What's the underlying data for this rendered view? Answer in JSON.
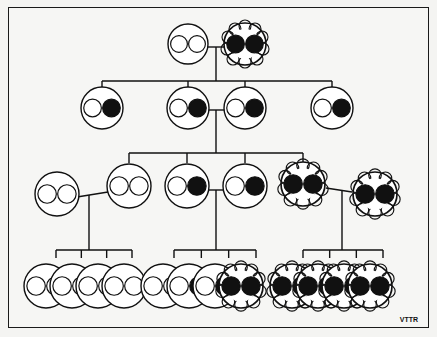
{
  "figure": {
    "signature": "VTTR",
    "colors": {
      "ink": "#111111",
      "paper": "#f6f6f4",
      "allele_dominant": "#111111",
      "allele_recessive": "#ffffff"
    }
  },
  "legend": {
    "plain_circle": "smooth-coat individual",
    "textured_cell": "rough/curly-coat individual",
    "open_dot": "recessive allele",
    "filled_dot": "dominant allele"
  },
  "generations": [
    {
      "label": "P",
      "individuals": [
        {
          "id": "p1",
          "phenotype": "smooth",
          "alleles": [
            "recessive",
            "recessive"
          ],
          "cx": 188,
          "cy": 44
        },
        {
          "id": "p2",
          "phenotype": "rough",
          "alleles": [
            "dominant",
            "dominant"
          ],
          "cx": 245,
          "cy": 44
        }
      ]
    },
    {
      "label": "F1",
      "individuals": [
        {
          "id": "f1a",
          "phenotype": "smooth",
          "alleles": [
            "recessive",
            "dominant"
          ],
          "cx": 102,
          "cy": 108
        },
        {
          "id": "f1b",
          "phenotype": "smooth",
          "alleles": [
            "recessive",
            "dominant"
          ],
          "cx": 188,
          "cy": 108
        },
        {
          "id": "f1c",
          "phenotype": "smooth",
          "alleles": [
            "recessive",
            "dominant"
          ],
          "cx": 245,
          "cy": 108
        },
        {
          "id": "f1d",
          "phenotype": "smooth",
          "alleles": [
            "recessive",
            "dominant"
          ],
          "cx": 332,
          "cy": 108
        }
      ]
    },
    {
      "label": "F2",
      "individuals": [
        {
          "id": "f2out1",
          "phenotype": "smooth",
          "alleles": [
            "recessive",
            "recessive"
          ],
          "cx": 57,
          "cy": 194
        },
        {
          "id": "f2a",
          "phenotype": "smooth",
          "alleles": [
            "recessive",
            "recessive"
          ],
          "cx": 129,
          "cy": 186
        },
        {
          "id": "f2b",
          "phenotype": "smooth",
          "alleles": [
            "recessive",
            "dominant"
          ],
          "cx": 187,
          "cy": 186
        },
        {
          "id": "f2c",
          "phenotype": "smooth",
          "alleles": [
            "recessive",
            "dominant"
          ],
          "cx": 245,
          "cy": 186
        },
        {
          "id": "f2d",
          "phenotype": "rough",
          "alleles": [
            "dominant",
            "dominant"
          ],
          "cx": 303,
          "cy": 184
        },
        {
          "id": "f2out2",
          "phenotype": "rough",
          "alleles": [
            "dominant",
            "dominant"
          ],
          "cx": 375,
          "cy": 194
        }
      ]
    },
    {
      "label": "F3",
      "groups": [
        {
          "parents": [
            "f2out1",
            "f2a"
          ],
          "offspring": [
            {
              "phenotype": "smooth",
              "alleles": [
                "recessive",
                "recessive"
              ]
            },
            {
              "phenotype": "smooth",
              "alleles": [
                "recessive",
                "recessive"
              ]
            },
            {
              "phenotype": "smooth",
              "alleles": [
                "recessive",
                "recessive"
              ]
            },
            {
              "phenotype": "smooth",
              "alleles": [
                "recessive",
                "recessive"
              ]
            }
          ]
        },
        {
          "parents": [
            "f2b",
            "f2c"
          ],
          "offspring": [
            {
              "phenotype": "smooth",
              "alleles": [
                "recessive",
                "recessive"
              ]
            },
            {
              "phenotype": "smooth",
              "alleles": [
                "recessive",
                "dominant"
              ]
            },
            {
              "phenotype": "smooth",
              "alleles": [
                "recessive",
                "dominant"
              ]
            },
            {
              "phenotype": "rough",
              "alleles": [
                "dominant",
                "dominant"
              ]
            }
          ]
        },
        {
          "parents": [
            "f2d",
            "f2out2"
          ],
          "offspring": [
            {
              "phenotype": "rough",
              "alleles": [
                "dominant",
                "dominant"
              ]
            },
            {
              "phenotype": "rough",
              "alleles": [
                "dominant",
                "dominant"
              ]
            },
            {
              "phenotype": "rough",
              "alleles": [
                "dominant",
                "dominant"
              ]
            },
            {
              "phenotype": "rough",
              "alleles": [
                "dominant",
                "dominant"
              ]
            }
          ]
        }
      ]
    }
  ]
}
